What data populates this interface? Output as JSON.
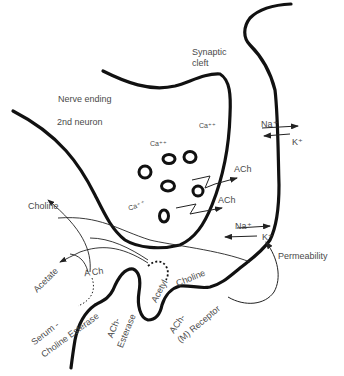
{
  "diagram": {
    "labels": {
      "synaptic_cleft_1": "Synaptic",
      "synaptic_cleft_2": "cleft",
      "nerve_ending": "Nerve ending",
      "second_neuron": "2nd neuron",
      "ca_1": "Ca⁺⁺",
      "ca_2": "Ca⁺⁺",
      "ca_3": "Ca⁺⁺",
      "ach_release_1": "ACh",
      "ach_release_2": "ACh",
      "na_top": "Na⁺",
      "k_top": "K⁺",
      "na_bottom": "Na⁺",
      "k_bottom": "K⁺",
      "permeability": "Permeability",
      "choline_left": "Choline",
      "acetate": "Acetate",
      "ach_split": "A Ch",
      "serum": "Serum -",
      "choline_esterase": "Choline Esterase",
      "ach_esterase_1": "ACh-",
      "ach_esterase_2": "Esterase",
      "acetyl": "Acetyl",
      "choline_right": "Choline",
      "ach_receptor_1": "ACh-",
      "ach_receptor_2": "(M) Receptor"
    },
    "colors": {
      "membrane": "#111111",
      "text": "#4a4a4a",
      "background": "#ffffff"
    }
  }
}
